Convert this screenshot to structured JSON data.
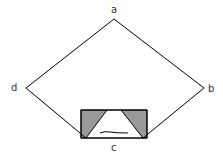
{
  "diagram": {
    "labels": {
      "a": "a",
      "b": "b",
      "c": "c",
      "d": "d"
    },
    "colors": {
      "line": "#000000",
      "fill": "#999999",
      "background": "#ffffff"
    }
  }
}
